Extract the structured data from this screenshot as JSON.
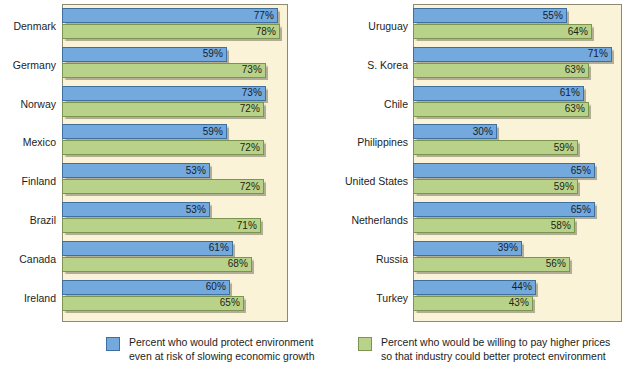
{
  "chart_data": {
    "type": "bar",
    "orientation": "horizontal",
    "title": "",
    "xlabel": "",
    "ylabel": "",
    "xlim": [
      0,
      100
    ],
    "grid": false,
    "legend_position": "bottom",
    "series": [
      {
        "name": "Percent who would protect environment even at risk of slowing economic growth",
        "color": "#74a9dd",
        "key": "blue"
      },
      {
        "name": "Percent who would be willing to pay higher prices so that industry could better protect environment",
        "color": "#b9d28a",
        "key": "green"
      }
    ],
    "panels": [
      {
        "id": "left",
        "categories": [
          "Denmark",
          "Germany",
          "Norway",
          "Mexico",
          "Finland",
          "Brazil",
          "Canada",
          "Ireland"
        ],
        "rows": [
          {
            "label": "Denmark",
            "blue": 77,
            "green": 78,
            "blue_label": "77%",
            "green_label": "78%"
          },
          {
            "label": "Germany",
            "blue": 59,
            "green": 73,
            "blue_label": "59%",
            "green_label": "73%"
          },
          {
            "label": "Norway",
            "blue": 73,
            "green": 72,
            "blue_label": "73%",
            "green_label": "72%"
          },
          {
            "label": "Mexico",
            "blue": 59,
            "green": 72,
            "blue_label": "59%",
            "green_label": "72%"
          },
          {
            "label": "Finland",
            "blue": 53,
            "green": 72,
            "blue_label": "53%",
            "green_label": "72%"
          },
          {
            "label": "Brazil",
            "blue": 53,
            "green": 71,
            "blue_label": "53%",
            "green_label": "71%"
          },
          {
            "label": "Canada",
            "blue": 61,
            "green": 68,
            "blue_label": "61%",
            "green_label": "68%"
          },
          {
            "label": "Ireland",
            "blue": 60,
            "green": 65,
            "blue_label": "60%",
            "green_label": "65%"
          }
        ]
      },
      {
        "id": "right",
        "categories": [
          "Uruguay",
          "S. Korea",
          "Chile",
          "Philippines",
          "United States",
          "Netherlands",
          "Russia",
          "Turkey"
        ],
        "rows": [
          {
            "label": "Uruguay",
            "blue": 55,
            "green": 64,
            "blue_label": "55%",
            "green_label": "64%"
          },
          {
            "label": "S. Korea",
            "blue": 71,
            "green": 63,
            "blue_label": "71%",
            "green_label": "63%"
          },
          {
            "label": "Chile",
            "blue": 61,
            "green": 63,
            "blue_label": "61%",
            "green_label": "63%"
          },
          {
            "label": "Philippines",
            "blue": 30,
            "green": 59,
            "blue_label": "30%",
            "green_label": "59%"
          },
          {
            "label": "United States",
            "blue": 65,
            "green": 59,
            "blue_label": "65%",
            "green_label": "59%"
          },
          {
            "label": "Netherlands",
            "blue": 65,
            "green": 58,
            "blue_label": "65%",
            "green_label": "58%"
          },
          {
            "label": "Russia",
            "blue": 39,
            "green": 56,
            "blue_label": "39%",
            "green_label": "56%"
          },
          {
            "label": "Turkey",
            "blue": 44,
            "green": 43,
            "blue_label": "44%",
            "green_label": "43%"
          }
        ]
      }
    ]
  },
  "legend": {
    "items": [
      {
        "key": "blue",
        "color": "#74a9dd",
        "text": "Percent who would protect environment\neven at risk of slowing economic growth"
      },
      {
        "key": "green",
        "color": "#b9d28a",
        "text": "Percent who would be willing to pay higher prices\nso that industry could better protect environment"
      }
    ]
  },
  "colors": {
    "panel_background": "#faf3d8",
    "panel_border": "#8e8a72",
    "blue": "#74a9dd",
    "green": "#b9d28a",
    "text": "#1d1d1d"
  }
}
